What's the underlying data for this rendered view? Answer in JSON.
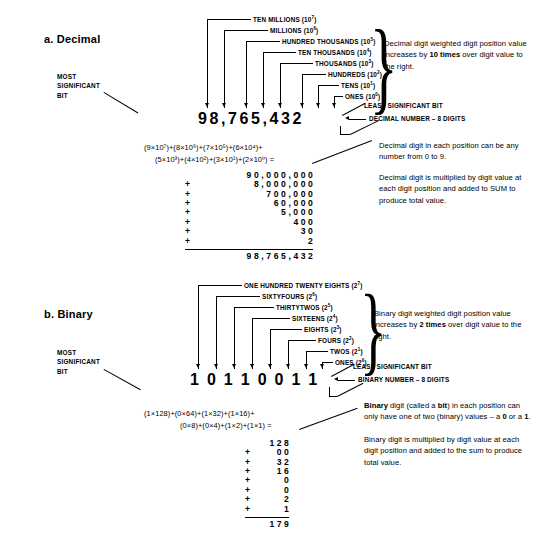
{
  "figure": {
    "sections": [
      {
        "id": "decimal",
        "header": "a.  Decimal",
        "msb_label": "MOST\nSIGNIFICANT\nBIT",
        "digits": [
          "9",
          "8",
          ",",
          "7",
          "6",
          "5",
          ",",
          "4",
          "3",
          "2"
        ],
        "place_labels": [
          {
            "name": "TEN MILLIONS",
            "power": "7",
            "base": "10"
          },
          {
            "name": "MILLIONS",
            "power": "6",
            "base": "10"
          },
          {
            "name": "HUNDRED THOUSANDS",
            "power": "5",
            "base": "10"
          },
          {
            "name": "TEN THOUSANDS",
            "power": "4",
            "base": "10"
          },
          {
            "name": "THOUSANDS",
            "power": "3",
            "base": "10"
          },
          {
            "name": "HUNDREDS",
            "power": "2",
            "base": "10"
          },
          {
            "name": "TENS",
            "power": "1",
            "base": "10"
          },
          {
            "name": "ONES",
            "power": "0",
            "base": "10"
          }
        ],
        "lsb_label": "LEAST SIGNIFICANT BIT",
        "number_label": "DECIMAL NUMBER – 8 DIGITS",
        "brace_note": "Decimal digit weighted digit position value increases by 10 times over digit value to the right.",
        "brace_note_html": "Decimal digit weighted digit position value increases by <b>10 times</b> over digit value to the right.",
        "callout_1": "Decimal digit in each position can be any number from 0 to 9.",
        "callout_2": "Decimal digit is multiplied by digit value at each digit position and added to SUM to produce total value.",
        "equation_line1": "(9×10⁷)+(8×10⁶)+(7×10⁵)+(6×10⁴)+",
        "equation_line2": "(5×10³)+(4×10²)+(3×10¹)+(2×10⁰) =",
        "sum_rows": [
          {
            "op": "",
            "value": "9 0 , 0 0 0 , 0 0 0"
          },
          {
            "op": "+",
            "value": "8 , 0 0 0 , 0 0 0"
          },
          {
            "op": "+",
            "value": "7 0 0 , 0 0 0"
          },
          {
            "op": "+",
            "value": "6 0 , 0 0 0"
          },
          {
            "op": "+",
            "value": "5 , 0 0 0"
          },
          {
            "op": "+",
            "value": "4 0 0"
          },
          {
            "op": "+",
            "value": "3 0"
          },
          {
            "op": "+",
            "value": "2"
          }
        ],
        "sum_total": "9 8 , 7 6 5 , 4 3 2"
      },
      {
        "id": "binary",
        "header": "b.  Binary",
        "msb_label": "MOST\nSIGNIFICANT\nBIT",
        "digits": [
          "1",
          "0",
          "1",
          "1",
          "0",
          "0",
          "1",
          "1"
        ],
        "place_labels": [
          {
            "name": "ONE HUNDRED TWENTY EIGHTS",
            "power": "7",
            "base": "2"
          },
          {
            "name": "SIXTYFOURS",
            "power": "6",
            "base": "2"
          },
          {
            "name": "THIRTYTWOS",
            "power": "5",
            "base": "2"
          },
          {
            "name": "SIXTEENS",
            "power": "4",
            "base": "2"
          },
          {
            "name": "EIGHTS",
            "power": "3",
            "base": "2"
          },
          {
            "name": "FOURS",
            "power": "2",
            "base": "2"
          },
          {
            "name": "TWOS",
            "power": "1",
            "base": "2"
          },
          {
            "name": "ONES",
            "power": "0",
            "base": "2"
          }
        ],
        "lsb_label": "LEAST SIGNIFICANT BIT",
        "number_label": "BINARY NUMBER – 8 DIGITS",
        "brace_note": "Binary digit weighted digit position value increases by 2 times over digit value to the right.",
        "brace_note_html": "Binary digit weighted digit position value increases by <b>2 times</b> over digit value to the right.",
        "callout_1": "Binary digit (called a bit) in each position can only have one of two (binary) values – a 0 or a 1.",
        "callout_1_html": "<b>Binary</b> digit (called a <b>bit</b>) in each position can only have one of two (binary) values – a <b>0</b> or a <b>1</b>.",
        "callout_2": "Binary digit is multiplied by digit value at each digit position and added to the sum to produce total value.",
        "equation_line1": "(1×128)+(0×64)+(1×32)+(1×16)+",
        "equation_line2": "(0×8)+(0×4)+(1×2)+(1×1) =",
        "sum_rows": [
          {
            "op": "",
            "value": "1 2 8"
          },
          {
            "op": "+",
            "value": "0 0"
          },
          {
            "op": "+",
            "value": "3 2"
          },
          {
            "op": "+",
            "value": "1 6"
          },
          {
            "op": "+",
            "value": "0"
          },
          {
            "op": "+",
            "value": "0"
          },
          {
            "op": "+",
            "value": "2"
          },
          {
            "op": "+",
            "value": "1"
          }
        ],
        "sum_total": "1 7 9"
      }
    ]
  }
}
